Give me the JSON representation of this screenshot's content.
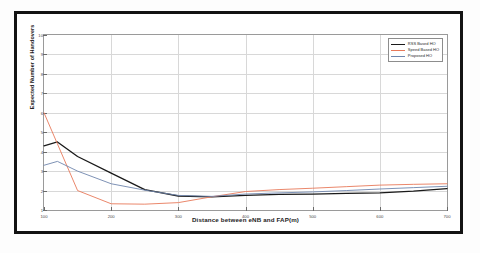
{
  "figure": {
    "frame_color": "#131313",
    "background": "#ffffff"
  },
  "chart_data": {
    "type": "line",
    "title": "",
    "xlabel": "Distance between eNB and FAP(m)",
    "ylabel": "Expected Number of Handovers",
    "xlim": [
      100,
      700
    ],
    "ylim": [
      1,
      10
    ],
    "xticks": [
      100,
      200,
      300,
      400,
      500,
      600,
      700
    ],
    "xticklabels": [
      "100",
      "200",
      "300",
      "400",
      "500",
      "600",
      "700"
    ],
    "yticks": [
      1,
      2,
      3,
      4,
      5,
      6,
      7,
      8,
      9,
      10
    ],
    "yticklabels": [
      "1",
      "2",
      "3",
      "4",
      "5",
      "6",
      "7",
      "8",
      "9",
      "10"
    ],
    "grid": true,
    "legend_position": "top-right",
    "x": [
      100,
      120,
      150,
      200,
      250,
      300,
      350,
      400,
      450,
      500,
      550,
      600,
      650,
      700
    ],
    "series": [
      {
        "name": "RSS Based HO",
        "color": "#1a1a1a",
        "values": [
          4.3,
          4.5,
          3.75,
          2.9,
          2.05,
          1.72,
          1.68,
          1.75,
          1.8,
          1.82,
          1.85,
          1.88,
          1.97,
          2.1
        ]
      },
      {
        "name": "Speed Based HO",
        "color": "#e8795a",
        "values": [
          6.0,
          4.4,
          2.0,
          1.32,
          1.3,
          1.38,
          1.68,
          1.95,
          2.05,
          2.12,
          2.2,
          2.28,
          2.32,
          2.35
        ]
      },
      {
        "name": "Proposed HO",
        "color": "#6f86ad",
        "values": [
          3.3,
          3.5,
          3.0,
          2.35,
          2.02,
          1.75,
          1.7,
          1.82,
          1.88,
          1.93,
          2.0,
          2.08,
          2.15,
          2.22
        ]
      }
    ]
  },
  "legend": {
    "items": [
      {
        "label": "RSS Based HO",
        "color": "#1a1a1a"
      },
      {
        "label": "Speed Based HO",
        "color": "#e8795a"
      },
      {
        "label": "Proposed HO",
        "color": "#6f86ad"
      }
    ]
  }
}
